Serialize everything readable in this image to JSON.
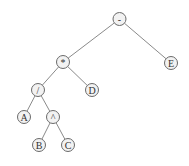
{
  "diagram": {
    "type": "expression-tree",
    "nodes": [
      {
        "id": "minus",
        "label": "-",
        "x": 119.5,
        "y": 19
      },
      {
        "id": "star",
        "label": "*",
        "x": 63,
        "y": 62
      },
      {
        "id": "E",
        "label": "E",
        "x": 171,
        "y": 63
      },
      {
        "id": "slash",
        "label": "/",
        "x": 38,
        "y": 90
      },
      {
        "id": "D",
        "label": "D",
        "x": 92,
        "y": 90
      },
      {
        "id": "A",
        "label": "A",
        "x": 24,
        "y": 117
      },
      {
        "id": "caret",
        "label": "^",
        "x": 53,
        "y": 117
      },
      {
        "id": "B",
        "label": "B",
        "x": 39,
        "y": 145
      },
      {
        "id": "C",
        "label": "C",
        "x": 68,
        "y": 145
      }
    ],
    "edges": [
      [
        "minus",
        "star"
      ],
      [
        "minus",
        "E"
      ],
      [
        "star",
        "slash"
      ],
      [
        "star",
        "D"
      ],
      [
        "slash",
        "A"
      ],
      [
        "slash",
        "caret"
      ],
      [
        "caret",
        "B"
      ],
      [
        "caret",
        "C"
      ]
    ],
    "node_radius": 6.5
  }
}
